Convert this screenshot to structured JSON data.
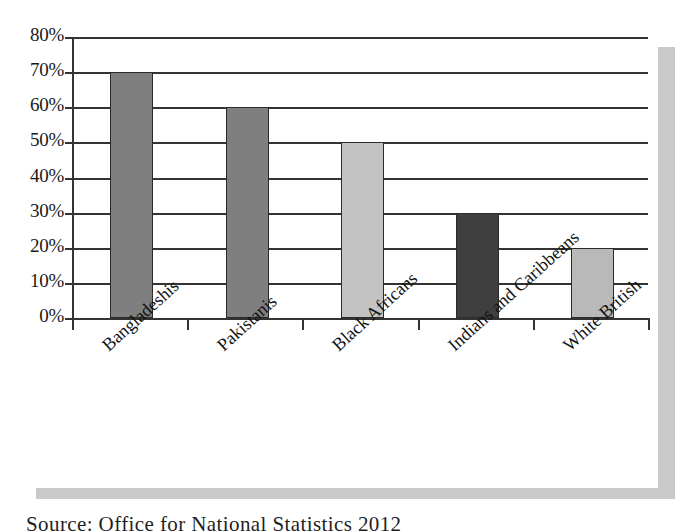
{
  "figure": {
    "background_color": "#ffffff",
    "shadow_color": "#c9c9c9",
    "axis_color": "#333333"
  },
  "caption": {
    "text": "Source: Office for National Statistics 2012"
  },
  "chart_data": {
    "type": "bar",
    "title": "",
    "subtitle": "",
    "xlabel": "",
    "ylabel": "",
    "categories": [
      "Bangladeshis",
      "Pakistanis",
      "Black Africans",
      "Indians and Caribbeans",
      "White British"
    ],
    "values": [
      70,
      60,
      50,
      30,
      20
    ],
    "value_labels": [
      "70%",
      "60%",
      "50%",
      "30%",
      "20%"
    ],
    "bar_colors": [
      "#7f7f7f",
      "#7f7f7f",
      "#c3c3c3",
      "#3f3f3f",
      "#b9b9b9"
    ],
    "bar_border_color": "#2b2b2b",
    "ylim": [
      0,
      80
    ],
    "ytick_values": [
      80,
      70,
      60,
      50,
      40,
      30,
      20,
      10,
      0
    ],
    "ytick_labels": [
      "80%",
      "70%",
      "60%",
      "50%",
      "40%",
      "30%",
      "20%",
      "10%",
      "0%"
    ],
    "grid": "horizontal",
    "legend": "none",
    "legend_position": "none",
    "label_rotation_degrees": -42
  }
}
